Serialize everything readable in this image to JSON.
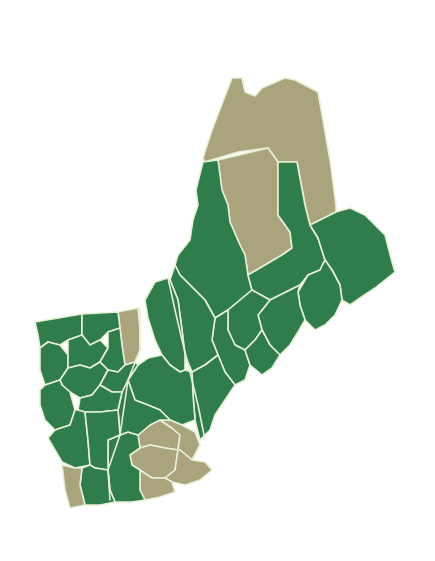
{
  "map": {
    "description": "Choropleth map of northern New England (Vermont, New Hampshire, Maine) showing regions in two categories",
    "colors": {
      "category_a": "#2e7d4a",
      "category_b": "#aaa47c",
      "border": "#e8efd8",
      "background": "#ffffff"
    },
    "states": [
      "Vermont",
      "New Hampshire",
      "Maine"
    ],
    "tan_regions_count_visible": 8,
    "legend": null
  }
}
